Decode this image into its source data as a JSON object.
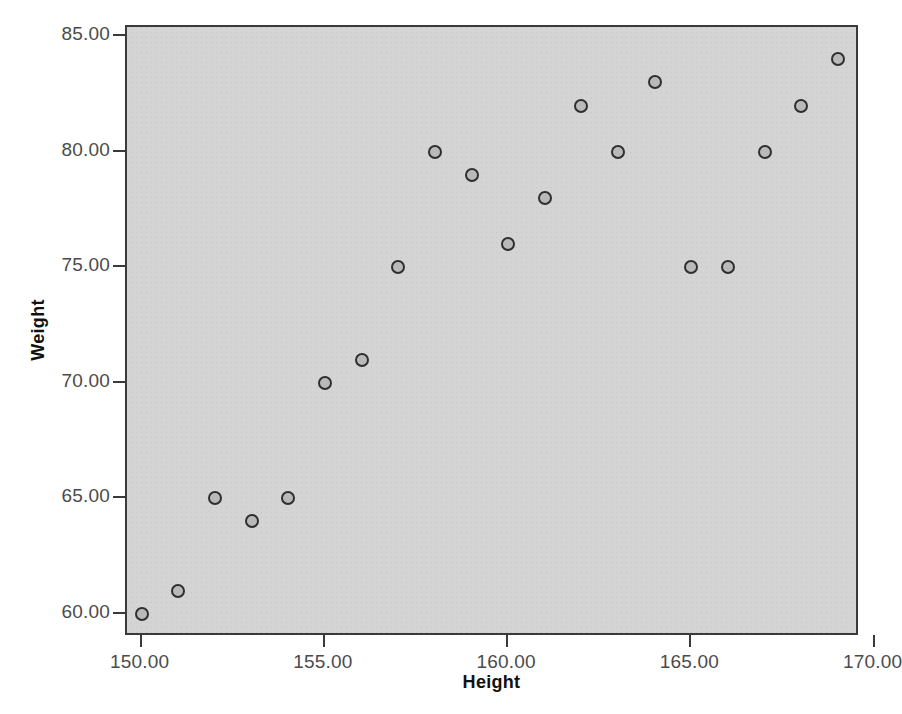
{
  "chart_data": {
    "type": "scatter",
    "title": "",
    "xlabel": "Height",
    "ylabel": "Weight",
    "xlim": [
      149.6,
      169.6
    ],
    "ylim": [
      59.0,
      85.4
    ],
    "xticks": [
      150,
      155,
      160,
      165,
      170
    ],
    "yticks": [
      60,
      65,
      70,
      75,
      80,
      85
    ],
    "xticklabels": [
      "150.00",
      "155.00",
      "160.00",
      "165.00",
      "170.00"
    ],
    "yticklabels": [
      "60.00",
      "65.00",
      "70.00",
      "75.00",
      "80.00",
      "85.00"
    ],
    "grid": false,
    "legend": null,
    "series": [
      {
        "name": "Height vs Weight",
        "x": [
          150,
          151,
          152,
          153,
          154,
          155,
          156,
          157,
          158,
          159,
          160,
          161,
          162,
          163,
          164,
          165,
          166,
          167,
          168,
          169
        ],
        "y": [
          60,
          61,
          65,
          64,
          65,
          70,
          71,
          75,
          80,
          79,
          76,
          78,
          82,
          80,
          83,
          75,
          75,
          80,
          82,
          84
        ],
        "marker": "circle",
        "marker_face_color": "#b9b9b9",
        "marker_edge_color": "#2f2f2f"
      }
    ],
    "points": [
      {
        "x": 150,
        "y": 60
      },
      {
        "x": 151,
        "y": 61
      },
      {
        "x": 152,
        "y": 65
      },
      {
        "x": 153,
        "y": 64
      },
      {
        "x": 154,
        "y": 65
      },
      {
        "x": 155,
        "y": 70
      },
      {
        "x": 156,
        "y": 71
      },
      {
        "x": 157,
        "y": 75
      },
      {
        "x": 158,
        "y": 80
      },
      {
        "x": 159,
        "y": 79
      },
      {
        "x": 160,
        "y": 76
      },
      {
        "x": 161,
        "y": 78
      },
      {
        "x": 162,
        "y": 82
      },
      {
        "x": 163,
        "y": 80
      },
      {
        "x": 164,
        "y": 83
      },
      {
        "x": 165,
        "y": 75
      },
      {
        "x": 166,
        "y": 75
      },
      {
        "x": 167,
        "y": 80
      },
      {
        "x": 168,
        "y": 82
      },
      {
        "x": 169,
        "y": 84
      }
    ]
  },
  "caption": "",
  "colors": {
    "panel_background": "#d4d4d4",
    "axis_line": "#3a3a3a",
    "tick_label": "#4b4b4b",
    "axis_title": "#111111",
    "page_background": "#ffffff"
  }
}
